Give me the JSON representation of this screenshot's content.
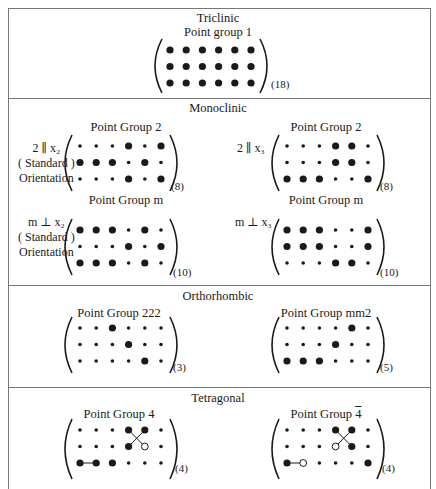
{
  "sections": [
    {
      "title": "Triclinic"
    },
    {
      "title": "Monoclinic"
    },
    {
      "title": "Orthorhombic"
    },
    {
      "title": "Tetragonal"
    }
  ],
  "matrices": {
    "triclinic": {
      "label": "Point group 1",
      "count": "(18)",
      "grid": [
        [
          2,
          2,
          2,
          2,
          2,
          2
        ],
        [
          2,
          2,
          2,
          2,
          2,
          2
        ],
        [
          2,
          2,
          2,
          2,
          2,
          2
        ]
      ]
    },
    "mono_2_x2": {
      "label": "Point Group 2",
      "count": "(8)",
      "side": [
        "2 ∥ x₂",
        "( Standard )",
        "Orientation"
      ],
      "grid": [
        [
          1,
          1,
          1,
          2,
          1,
          2
        ],
        [
          2,
          2,
          2,
          1,
          2,
          1
        ],
        [
          1,
          1,
          1,
          2,
          1,
          2
        ]
      ]
    },
    "mono_2_x3": {
      "label": "Point Group 2",
      "count": "(8)",
      "side": [
        "2 ∥ x₃"
      ],
      "grid": [
        [
          1,
          1,
          1,
          2,
          2,
          1
        ],
        [
          1,
          1,
          1,
          2,
          2,
          1
        ],
        [
          2,
          2,
          2,
          1,
          1,
          2
        ]
      ]
    },
    "mono_m_x2": {
      "label": "Point Group m",
      "count": "(10)",
      "side": [
        "m ⊥ x₂",
        "( Standard )",
        "Orientation"
      ],
      "grid": [
        [
          2,
          2,
          2,
          1,
          2,
          1
        ],
        [
          1,
          1,
          1,
          2,
          1,
          2
        ],
        [
          2,
          2,
          2,
          1,
          2,
          1
        ]
      ]
    },
    "mono_m_x3": {
      "label": "Point Group m",
      "count": "(10)",
      "side": [
        "m ⊥ x₃"
      ],
      "grid": [
        [
          2,
          2,
          2,
          1,
          1,
          2
        ],
        [
          2,
          2,
          2,
          1,
          1,
          2
        ],
        [
          1,
          1,
          1,
          2,
          2,
          1
        ]
      ]
    },
    "ortho_222": {
      "label": "Point Group 222",
      "count": "(3)",
      "grid": [
        [
          1,
          1,
          2,
          1,
          1,
          1
        ],
        [
          1,
          1,
          1,
          2,
          1,
          1
        ],
        [
          1,
          1,
          1,
          1,
          2,
          1
        ]
      ]
    },
    "ortho_mm2": {
      "label": "Point Group mm2",
      "count": "(5)",
      "grid": [
        [
          1,
          1,
          1,
          1,
          2,
          1
        ],
        [
          1,
          1,
          1,
          2,
          1,
          1
        ],
        [
          2,
          2,
          2,
          1,
          1,
          1
        ]
      ]
    },
    "tetra_4": {
      "label": "Point Group 4",
      "count": "(4)",
      "grid": [
        [
          1,
          1,
          1,
          2,
          2,
          1
        ],
        [
          1,
          1,
          1,
          2,
          3,
          1
        ],
        [
          2,
          2,
          2,
          1,
          1,
          1
        ]
      ],
      "links": [
        [
          [
            0,
            3
          ],
          [
            1,
            4
          ]
        ],
        [
          [
            0,
            4
          ],
          [
            1,
            3
          ]
        ],
        [
          [
            2,
            0
          ],
          [
            2,
            1
          ]
        ]
      ]
    },
    "tetra_4bar": {
      "label_prefix": "Point Group ",
      "label_symbol": "4",
      "count": "(4)",
      "grid": [
        [
          1,
          1,
          1,
          2,
          2,
          1
        ],
        [
          1,
          1,
          1,
          3,
          2,
          1
        ],
        [
          2,
          3,
          1,
          1,
          1,
          2
        ]
      ],
      "links": [
        [
          [
            0,
            3
          ],
          [
            1,
            4
          ]
        ],
        [
          [
            0,
            4
          ],
          [
            1,
            3
          ]
        ],
        [
          [
            2,
            0
          ],
          [
            2,
            1
          ]
        ]
      ]
    }
  },
  "legend": {
    "1": "small dot",
    "2": "large dot",
    "3": "open circle"
  }
}
